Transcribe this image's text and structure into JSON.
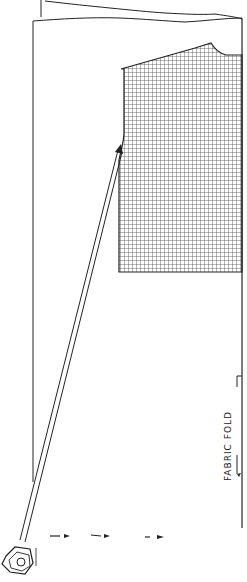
{
  "diagram": {
    "type": "sewing-pattern-layout",
    "fold_label": "FABRIC FOLD",
    "colors": {
      "ink": "#222222",
      "grid": "#333333",
      "background": "#ffffff"
    },
    "elements": {
      "fabric_sheet": "fabric-rectangle",
      "pattern_piece": "checked-bodice-piece",
      "grain_arrow": "double-line-arrow",
      "hardware": "hex-nut",
      "dashes": 3
    }
  }
}
